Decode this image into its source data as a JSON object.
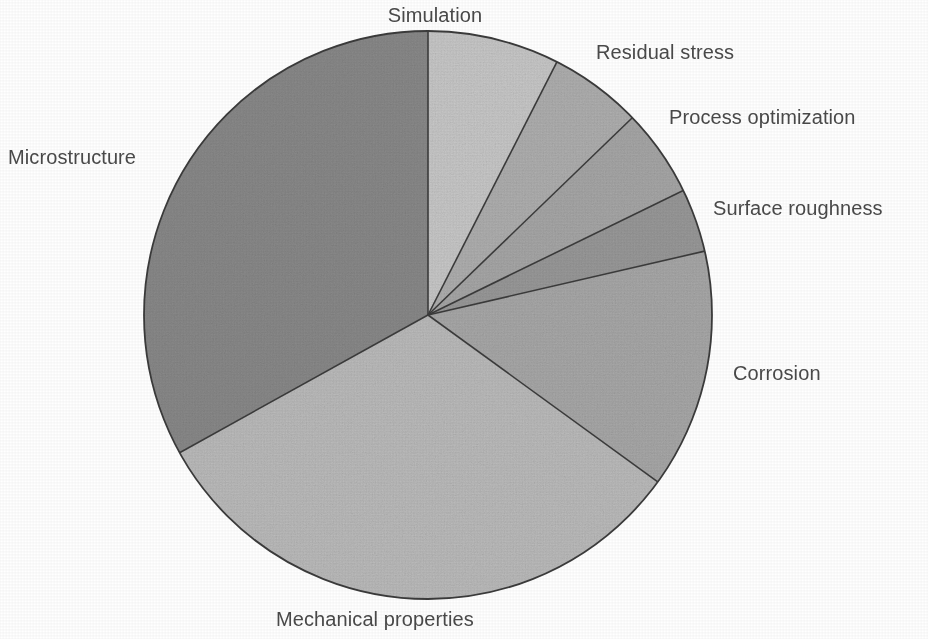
{
  "chart_data": {
    "type": "pie",
    "title": "",
    "subtitle": "",
    "xlabel": "",
    "ylabel": "",
    "legend_position": "none",
    "grid": false,
    "labels_outside": true,
    "start_angle_deg": 0,
    "direction": "clockwise",
    "center": {
      "x": 428,
      "y": 315
    },
    "radius": 284,
    "categories": [
      "Simulation",
      "Residual stress",
      "Process optimization",
      "Surface roughness",
      "Corrosion",
      "Mechanical properties",
      "Microstructure"
    ],
    "values": [
      7.5,
      5.3,
      5.0,
      3.6,
      13.6,
      31.9,
      33.1
    ],
    "value_unit": "%",
    "slices": [
      {
        "label": "Simulation",
        "value": 7.5,
        "start_deg": 0,
        "end_deg": 27,
        "sweep_deg": 27,
        "color": "#c9c9c9",
        "label_x": 435,
        "label_y": 4,
        "label_anchor": "middle"
      },
      {
        "label": "Residual stress",
        "value": 5.3,
        "start_deg": 27,
        "end_deg": 46,
        "sweep_deg": 19,
        "color": "#b0b0b0",
        "label_x": 596,
        "label_y": 41,
        "label_anchor": "start"
      },
      {
        "label": "Process optimization",
        "value": 5.0,
        "start_deg": 46,
        "end_deg": 64,
        "sweep_deg": 18,
        "color": "#a8a8a8",
        "label_x": 669,
        "label_y": 106,
        "label_anchor": "start"
      },
      {
        "label": "Surface roughness",
        "value": 3.6,
        "start_deg": 64,
        "end_deg": 77,
        "sweep_deg": 13,
        "color": "#9a9a9a",
        "label_x": 713,
        "label_y": 197,
        "label_anchor": "start"
      },
      {
        "label": "Corrosion",
        "value": 13.6,
        "start_deg": 77,
        "end_deg": 126,
        "sweep_deg": 49,
        "color": "#a9a9a9",
        "label_x": 733,
        "label_y": 362,
        "label_anchor": "start"
      },
      {
        "label": "Mechanical properties",
        "value": 31.9,
        "start_deg": 126,
        "end_deg": 241,
        "sweep_deg": 115,
        "color": "#bcbcbc",
        "label_x": 276,
        "label_y": 608,
        "label_anchor": "start"
      },
      {
        "label": "Microstructure",
        "value": 33.1,
        "start_deg": 241,
        "end_deg": 360,
        "sweep_deg": 119,
        "color": "#8a8a8a",
        "label_x": 8,
        "label_y": 146,
        "label_anchor": "start"
      }
    ],
    "outline_color": "#3b3b3b",
    "background_color": "#ffffff",
    "label_color": "#4a4a4a"
  },
  "labels": {
    "simulation": "Simulation",
    "residual_stress": "Residual stress",
    "process_optimization": "Process optimization",
    "surface_roughness": "Surface roughness",
    "corrosion": "Corrosion",
    "mechanical_properties": "Mechanical properties",
    "microstructure": "Microstructure"
  }
}
